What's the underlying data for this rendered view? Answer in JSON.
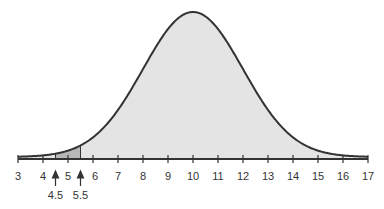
{
  "chart_data": {
    "type": "area",
    "title": "",
    "xlabel": "",
    "ylabel": "",
    "distribution": {
      "name": "normal",
      "mean": 10,
      "sd": 2
    },
    "xlim": [
      3,
      17
    ],
    "x_ticks": [
      3,
      4,
      5,
      6,
      7,
      8,
      9,
      10,
      11,
      12,
      13,
      14,
      15,
      16,
      17
    ],
    "tick_labels": [
      "3",
      "4",
      "5",
      "6",
      "7",
      "8",
      "9",
      "10",
      "11",
      "12",
      "13",
      "14",
      "15",
      "16",
      "17"
    ],
    "shaded_region": {
      "from": 4.5,
      "to": 5.5,
      "label_from": "4.5",
      "label_to": "5.5"
    },
    "annotations": [
      {
        "x": 4.5,
        "text": "4.5",
        "marker": "up-arrow"
      },
      {
        "x": 5.5,
        "text": "5.5",
        "marker": "up-arrow"
      }
    ],
    "grid": false,
    "legend": null
  },
  "colors": {
    "curve": "#333333",
    "fill": "#e4e4e4",
    "shaded": "#b8b8b8",
    "axis": "#333333"
  }
}
